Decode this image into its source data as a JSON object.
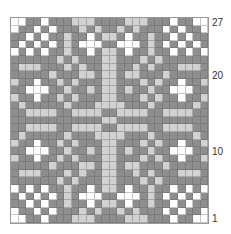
{
  "chart": {
    "columns": 26,
    "rows": 27,
    "palette": {
      "D": "#8e8e8e",
      "L": "#d2d2d2",
      "W": "#ffffff"
    },
    "row_labels": [
      {
        "label": "27",
        "row": 27
      },
      {
        "label": "20",
        "row": 20
      },
      {
        "label": "10",
        "row": 10
      },
      {
        "label": "1",
        "row": 1
      }
    ],
    "grid_top_to_bottom": [
      "WWDDWDDDLLLDDDDLLLDDDWDDWW",
      "WDDWDWDDDLDLDDLDLDDDWDWDDW",
      "DDWDWDDLDDWDLLDWDDLDDWDWDD",
      "DWDWDWDLDWWWDDWWWDLDWDWDWD",
      "WDWDWDDLDDWDLLDWDDLDDWDWDW",
      "DDDDDDLDLDDDLLDDDLDLDDDDDD",
      "DLLLDDDLDLDDLLDDLDLDDDLLLD",
      "DDDDDLDDDLLDLLDLLDDDLDDDDD",
      "LDDWDDLDLDDDLLDDDLDLDDWDDL",
      "DDWWWDDLDDLDLLDLDDLDDWWWDD",
      "LDDWDDLDLDDDLLDDDLDLDDWDDL",
      "DLDDDDDLDDDLLLLDDDLDDDDDLD",
      "DDLLLLDDLLLLDDLLLLDDLLLLDD",
      "DDDDDDDDDDDDLLDDDDDDDDDDDD",
      "DDLLLLDDLLLLDDLLLLDDLLLLDD",
      "DLDDDDDLDDDLLLLDDDLDDDDDLD",
      "LDDWDDLDLDDDLLDDDLDLDDWDDL",
      "DDWWWDDLDDLDLLDLDDLDDWWWDD",
      "LDDWDDLDLDDDLLDDDLDLDDWDDL",
      "DDDDDLDDDLLDLLDLLDDDLDDDDD",
      "DLLLDDDLDLDDLLDDLDLDDDLLLD",
      "DDDDDDLDLDDDLLDDDLDLDDDDDD",
      "WDWDWDDLDDWDLLDWDDLDDWDWDW",
      "DWDWDWDLDWWWDDWWWDLDWDWDWD",
      "DDWDWDDLDDWDLLDWDDLDDWDWDD",
      "WDDWDWDDDLDLDDLDLDDDWDWDDW",
      "WWDDWDDDLLLDDDDLLLDDDWDDWW"
    ]
  }
}
